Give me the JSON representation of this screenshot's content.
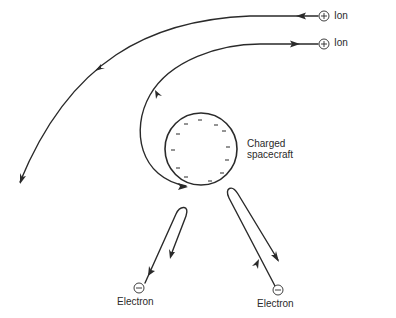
{
  "diagram": {
    "title": "",
    "colors": {
      "stroke": "#2a2a2a",
      "background": "#ffffff"
    },
    "spacecraft": {
      "label_line1": "Charged",
      "label_line2": "spacecraft",
      "charge": "negative",
      "surface_charge_marks": 14
    },
    "ions": [
      {
        "label": "Ion",
        "symbol": "⊕",
        "charge": "positive",
        "trajectory": "deflected away to lower-left"
      },
      {
        "label": "Ion",
        "symbol": "⊕",
        "charge": "positive",
        "trajectory": "attracted around spacecraft"
      }
    ],
    "electrons": [
      {
        "label": "Electron",
        "symbol": "⊖",
        "charge": "negative",
        "trajectory": "repelled, reverses"
      },
      {
        "label": "Electron",
        "symbol": "⊖",
        "charge": "negative",
        "trajectory": "repelled, reverses"
      }
    ]
  }
}
